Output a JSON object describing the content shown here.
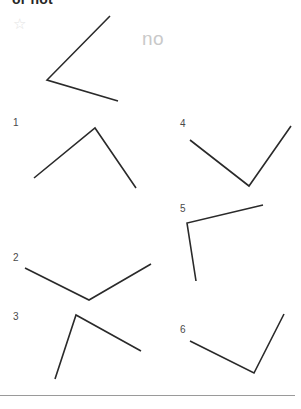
{
  "header": {
    "text": "or not",
    "clipped": true
  },
  "star": {
    "icon": "star-outline-icon",
    "glyph": "☆",
    "color": "#e3e3e3"
  },
  "watermark": {
    "text": "no",
    "color": "#c9c9c9"
  },
  "colors": {
    "stroke": "#2a2a2a",
    "label": "#4a4a4a",
    "divider": "#9a9a9a",
    "background": "#ffffff"
  },
  "figures": [
    {
      "id": "figure-top",
      "label": "",
      "label_x": 0,
      "label_y": 0,
      "points": "110,16 47,80 118,101",
      "vertex": "47,80"
    },
    {
      "id": "figure-1",
      "label": "1",
      "label_x": 13,
      "label_y": 117,
      "points": "34,178 95,128 136,188",
      "vertex": "95,128"
    },
    {
      "id": "figure-4",
      "label": "4",
      "label_x": 180,
      "label_y": 118,
      "points": "190,140 249,186 291,126",
      "vertex": "249,186"
    },
    {
      "id": "figure-5",
      "label": "5",
      "label_x": 180,
      "label_y": 203,
      "points": "263,205 187,223 196,281",
      "vertex": "187,223"
    },
    {
      "id": "figure-2",
      "label": "2",
      "label_x": 13,
      "label_y": 252,
      "points": "25,268 89,300 151,264",
      "vertex": "89,300"
    },
    {
      "id": "figure-3",
      "label": "3",
      "label_x": 13,
      "label_y": 311,
      "points": "55,379 76,315 141,351",
      "vertex": "76,315"
    },
    {
      "id": "figure-6",
      "label": "6",
      "label_x": 180,
      "label_y": 324,
      "points": "190,341 254,373 284,314",
      "vertex": "254,373"
    }
  ],
  "divider": {
    "name": "bottom-divider"
  }
}
